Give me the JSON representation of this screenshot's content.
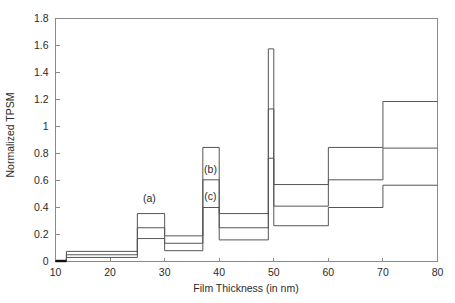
{
  "chart_data": {
    "type": "line",
    "title": "",
    "xlabel": "Film Thickness (in nm)",
    "ylabel": "Normalized TPSM",
    "xlim": [
      10,
      80
    ],
    "ylim": [
      0,
      1.8
    ],
    "grid": false,
    "legend_position": "inline-annotations",
    "xticks": [
      10,
      20,
      30,
      40,
      50,
      60,
      70,
      80
    ],
    "xtick_labels": [
      "10",
      "20",
      "30",
      "40",
      "50",
      "60",
      "70",
      "80"
    ],
    "yticks": [
      0,
      0.2,
      0.4,
      0.6,
      0.8,
      1.0,
      1.2,
      1.4,
      1.6,
      1.8
    ],
    "ytick_labels": [
      "0",
      "0.2",
      "0.4",
      "0.6",
      "0.8",
      "1",
      "1.2",
      "1.4",
      "1.6",
      "1.8"
    ],
    "bin_edges": [
      10,
      12,
      25,
      30,
      37,
      40,
      49,
      50,
      60,
      70,
      80
    ],
    "series": [
      {
        "name": "(a)",
        "label": "(a)",
        "values": [
          0.0,
          0.075,
          0.355,
          0.19,
          0.845,
          0.355,
          1.575,
          0.57,
          0.845,
          1.185
        ]
      },
      {
        "name": "(b)",
        "label": "(b)",
        "values": [
          0.0,
          0.05,
          0.25,
          0.135,
          0.605,
          0.25,
          1.13,
          0.41,
          0.605,
          0.84
        ]
      },
      {
        "name": "(c)",
        "label": "(c)",
        "values": [
          0.0,
          0.03,
          0.17,
          0.08,
          0.4,
          0.16,
          0.765,
          0.265,
          0.4,
          0.565
        ]
      }
    ],
    "annotations": [
      {
        "text": "(a)",
        "x": 27.2,
        "y": 0.44
      },
      {
        "text": "(b)",
        "x": 38.4,
        "y": 0.655
      },
      {
        "text": "(c)",
        "x": 38.4,
        "y": 0.455
      }
    ]
  },
  "colors": {
    "background": "#ffffff",
    "axis": "#8a8a8a",
    "series_line": "#555555",
    "text": "#2b2b2b",
    "baseline_marker": "#111111"
  }
}
